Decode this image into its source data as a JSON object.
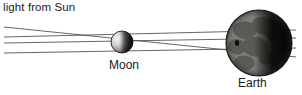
{
  "figure": {
    "title_text": "light from Sun",
    "background_color": "#ffffff",
    "width": 302,
    "height": 95
  },
  "labels": {
    "sun_light": "light from Sun",
    "moon": "Moon",
    "earth": "Earth"
  },
  "chart_data": {
    "type": "diagram",
    "title": "light from Sun",
    "bodies": [
      {
        "name": "Moon",
        "label": "Moon",
        "center_x": 122,
        "center_y": 42,
        "radius": 11,
        "lit_side": "left",
        "lit_color": "#d8d8d8",
        "shadow_color": "#1c1c1c"
      },
      {
        "name": "Earth",
        "label": "Earth",
        "center_x": 259,
        "center_y": 43,
        "radius": 33,
        "lit_side": "left",
        "lit_color": "#e6e4de",
        "shadow_color": "#0f0f0f"
      }
    ],
    "rays": [
      {
        "id": "ray-1",
        "x1": 4,
        "y1": 27,
        "x2": 296,
        "y2": 57,
        "description": "upper outer ray, descends to lower Earth"
      },
      {
        "id": "ray-2",
        "x1": 4,
        "y1": 37,
        "x2": 296,
        "y2": 30,
        "description": "upper inner ray, tangent above Moon, rises toward upper Earth"
      },
      {
        "id": "ray-3",
        "x1": 4,
        "y1": 43,
        "x2": 296,
        "y2": 38,
        "description": "lower inner ray, tangent below Moon, rises toward Earth"
      },
      {
        "id": "ray-4",
        "x1": 4,
        "y1": 53,
        "x2": 296,
        "y2": 48,
        "description": "lower outer ray toward Earth mid-lower"
      }
    ],
    "ray_color": "#4a4a4a",
    "ray_count": 4,
    "legend": [],
    "annotations": [
      {
        "text": "light from Sun",
        "x": 3,
        "y": 10
      },
      {
        "text": "Moon",
        "x": 109,
        "y": 68
      },
      {
        "text": "Earth",
        "x": 238,
        "y": 86
      }
    ]
  }
}
